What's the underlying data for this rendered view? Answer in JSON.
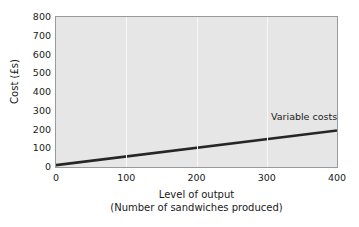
{
  "chart_data": {
    "type": "line",
    "title": "",
    "xlabel": "Level of output",
    "xlabel_sub": "(Number of sandwiches produced)",
    "ylabel": "Cost (£s)",
    "xlim": [
      0,
      400
    ],
    "ylim": [
      0,
      800
    ],
    "xticks": [
      "0",
      "100",
      "200",
      "300",
      "400"
    ],
    "xtick_values": [
      0,
      100,
      200,
      300,
      400
    ],
    "yticks": [
      "0",
      "100",
      "200",
      "300",
      "400",
      "500",
      "600",
      "700",
      "800"
    ],
    "ytick_values": [
      0,
      100,
      200,
      300,
      400,
      500,
      600,
      700,
      800
    ],
    "grid": "vertical-only",
    "grid_x_values": [
      100,
      200,
      300
    ],
    "legend": "inline-annotation",
    "series": [
      {
        "name": "Variable costs",
        "x": [
          0,
          400
        ],
        "values": [
          10,
          195
        ],
        "color": "#262626",
        "line_width": 2.6,
        "label_text": "Variable costs"
      }
    ],
    "colors": {
      "plot_background": "#e6e6e6",
      "figure_background": "#ffffff",
      "axis_border": "#9a9a9a",
      "gridline": "#f7f7f7",
      "text": "#1a1a1a",
      "series_line": "#262626"
    }
  }
}
